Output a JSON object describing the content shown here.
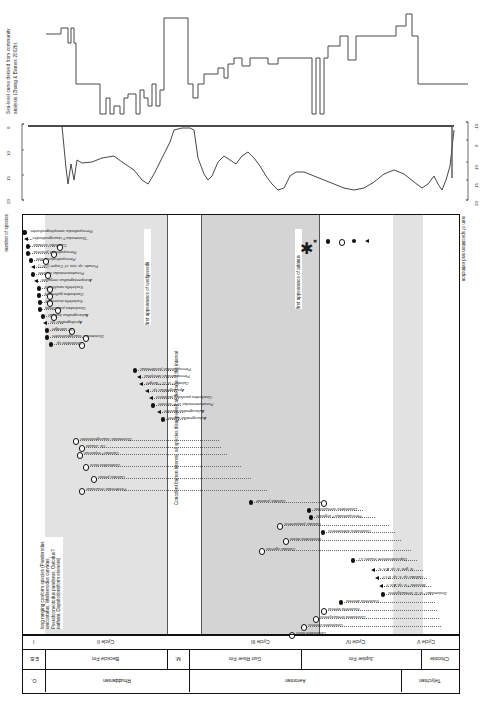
{
  "figure": {
    "panel_a": {
      "label": "Sea-level curve derived from community analysis (Zhang & Barnes 2002b)",
      "series_name": "sea-level-step-curve"
    },
    "panel_b": {
      "left_axis_ticks": [
        "0",
        "10",
        "15",
        "20"
      ],
      "right_axis_ticks": [
        "-10",
        "0",
        "10",
        "15",
        "20"
      ],
      "series_name": "bathymetry-curve"
    },
    "panel_c": {
      "left_axis_label": "number of species",
      "right_axis_label": "sum of speciation and extinction",
      "annotations": [
        "first appearance of wedgewedii",
        "Conodont barren interval, all species disappeared at the base of the interval",
        "first appearance of aitanus",
        "long ranging conform species (Panderodus unicostatus, Walliserodus curvatus, Pseudooneotodus panderus, Oulodus? nathani, Dapsilodontiform element)"
      ]
    },
    "legend": {
      "title": "legend",
      "entries": [
        {
          "symbol": "star",
          "label": "reappearance and last appearance at the same level"
        },
        {
          "symbol": "cross",
          "label": "reappearance"
        },
        {
          "symbol": "filled-circle",
          "label": "first and last appearance at the same level"
        },
        {
          "symbol": "open-circle",
          "label": "last appearance"
        },
        {
          "symbol": "filled-dot",
          "label": "first appearance"
        },
        {
          "symbol": "triangle",
          "label": "first appearance in Ordovician"
        }
      ]
    },
    "chart_data": {
      "type": "table",
      "title": "Conodont species ranges, Anticosti Island",
      "xlabel": "stratigraphic position",
      "ylabel": "species",
      "species": [
        {
          "name": "Pterospathodus amorphognathoides",
          "y": 228,
          "first": 1.5,
          "last": 3.0,
          "sym_first": "filled",
          "sym_last": "none"
        },
        {
          "name": "\"Distomodus? staurognathoides\"",
          "y": 235,
          "first": 3.0,
          "last": 8.0,
          "sym_first": "tri",
          "sym_last": "none"
        },
        {
          "name": "Carniodus carnulus",
          "y": 242,
          "first": 5.0,
          "last": 36.0,
          "sym_first": "filled",
          "sym_last": "open"
        },
        {
          "name": "Pterospathodus procerus",
          "y": 249,
          "first": 5.0,
          "last": 30.0,
          "sym_first": "filled",
          "sym_last": "open"
        },
        {
          "name": "Pterospathodus celloni",
          "y": 256,
          "first": 8.0,
          "last": 22.0,
          "sym_first": "filled",
          "sym_last": "open"
        },
        {
          "name": "Pseudo. sp. nov. cf. Cooper (1977)",
          "y": 263,
          "first": 10.0,
          "last": 22.0,
          "sym_first": "tri",
          "sym_last": "none"
        },
        {
          "name": "Pseudooneotodus tricornis",
          "y": 270,
          "first": 10.0,
          "last": 24.0,
          "sym_first": "filled",
          "sym_last": "open"
        },
        {
          "name": "Astropentagnathus irregularis",
          "y": 277,
          "first": 13.0,
          "last": 24.0,
          "sym_first": "tri",
          "sym_last": "none"
        },
        {
          "name": "Kockelella ranuliformis",
          "y": 284,
          "first": 16.0,
          "last": 26.0,
          "sym_first": "filled",
          "sym_last": "open"
        },
        {
          "name": "Ozarkodina gulletensis",
          "y": 291,
          "first": 16.0,
          "last": 26.0,
          "sym_first": "filled",
          "sym_last": "open"
        },
        {
          "name": "Kockelella inconstans",
          "y": 298,
          "first": 17.0,
          "last": 26.0,
          "sym_first": "filled",
          "sym_last": "open"
        },
        {
          "name": "Ozarkodina polinclinata",
          "y": 305,
          "first": 17.0,
          "last": 34.0,
          "sym_first": "filled",
          "sym_last": "open"
        },
        {
          "name": "Aulacognathus bullatus",
          "y": 312,
          "first": 20.0,
          "last": 30.0,
          "sym_first": "filled",
          "sym_last": "open"
        },
        {
          "name": "Apsidognathus sp.",
          "y": 319,
          "first": 22.0,
          "last": 40.0,
          "sym_first": "tri",
          "sym_last": "none"
        },
        {
          "name": "Oz. aldridgei",
          "y": 326,
          "first": 24.0,
          "last": 48.0,
          "sym_first": "filled",
          "sym_last": "open"
        },
        {
          "name": "Distomodus staurognathoides",
          "y": 333,
          "first": 24.0,
          "last": 62.0,
          "sym_first": "filled",
          "sym_last": "open"
        },
        {
          "name": "Ozarkodina sp.",
          "y": 340,
          "first": 28.0,
          "last": 58.0,
          "sym_first": "filled",
          "sym_last": "open"
        },
        {
          "name": "Pterospathodus postdentatus",
          "y": 366,
          "first": 112.0,
          "last": 150.0,
          "sym_first": "filled",
          "sym_last": "none"
        },
        {
          "name": "Pterospathodus amorphus",
          "y": 373,
          "first": 116.0,
          "last": 152.0,
          "sym_first": "tri",
          "sym_last": "none"
        },
        {
          "name": "Oulodus? cf. O.? fluegeli",
          "y": 380,
          "first": 118.0,
          "last": 152.0,
          "sym_first": "tri",
          "sym_last": "none"
        },
        {
          "name": "Apsidognathus sp.",
          "y": 387,
          "first": 124.0,
          "last": 154.0,
          "sym_first": "tri",
          "sym_last": "none"
        },
        {
          "name": "Ozarkodina parahassi parahassi",
          "y": 394,
          "first": 128.0,
          "last": 156.0,
          "sym_first": "tri",
          "sym_last": "none"
        },
        {
          "name": "Pseudooneotodus cf. P. bicornis",
          "y": 401,
          "first": 130.0,
          "last": 158.0,
          "sym_first": "filled",
          "sym_last": "none"
        },
        {
          "name": "Aulacognathus bashkiri",
          "y": 408,
          "first": 136.0,
          "last": 160.0,
          "sym_first": "tri",
          "sym_last": "none"
        },
        {
          "name": "Aulacognathus kuehni",
          "y": 415,
          "first": 140.0,
          "last": 162.0,
          "sym_first": "filled",
          "sym_last": "none"
        },
        {
          "name": "Distomodus staurognathoides",
          "y": 436,
          "first": 52.0,
          "last": 196.0,
          "sym_first": "open",
          "sym_last": "none"
        },
        {
          "name": "Oz. clavula",
          "y": 443,
          "first": 58.0,
          "last": 198.0,
          "sym_first": "open",
          "sym_last": "none"
        },
        {
          "name": "Oulodus? expansus",
          "y": 450,
          "first": 56.0,
          "last": 204.0,
          "sym_first": "open",
          "sym_last": "none"
        },
        {
          "name": "Ozarkodina hassi",
          "y": 462,
          "first": 62.0,
          "last": 218.0,
          "sym_first": "open",
          "sym_last": "none"
        },
        {
          "name": "Oulodus petilus",
          "y": 474,
          "first": 70.0,
          "last": 228.0,
          "sym_first": "open",
          "sym_last": "none"
        },
        {
          "name": "Panderodus recurvatus",
          "y": 486,
          "first": 58.0,
          "last": 244.0,
          "sym_first": "open",
          "sym_last": "none"
        },
        {
          "name": "Oulodus jeannae",
          "y": 498,
          "first": 228.0,
          "last": 300.0,
          "sym_first": "filled",
          "sym_last": "open"
        },
        {
          "name": "Ozarkodina strenuiformis",
          "y": 506,
          "first": 286.0,
          "last": 340.0,
          "sym_first": "filled",
          "sym_last": "none"
        },
        {
          "name": "Pterospathodus? originalis",
          "y": 513,
          "first": 288.0,
          "last": 352.0,
          "sym_first": "filled",
          "sym_last": "none"
        },
        {
          "name": "Oulodus panuarensis",
          "y": 521,
          "first": 256.0,
          "last": 366.0,
          "sym_first": "open",
          "sym_last": "none"
        },
        {
          "name": "Ozarkodina oldhamensis",
          "y": 528,
          "first": 300.0,
          "last": 372.0,
          "sym_first": "filled",
          "sym_last": "none"
        },
        {
          "name": "Ozarkodina divina",
          "y": 536,
          "first": 262.0,
          "last": 378.0,
          "sym_first": "open",
          "sym_last": "none"
        },
        {
          "name": "Oulodus agrestis",
          "y": 546,
          "first": 238.0,
          "last": 388.0,
          "sym_first": "open",
          "sym_last": "none"
        },
        {
          "name": "Dapsilodontiform elutans s.l.",
          "y": 556,
          "first": 330.0,
          "last": 394.0,
          "sym_first": "filled",
          "sym_last": "none"
        },
        {
          "name": "N. gen. n. sp. A n. n.",
          "y": 566,
          "first": 350.0,
          "last": 400.0,
          "sym_first": "tri",
          "sym_last": "none"
        },
        {
          "name": "Oulodus sp. n. sp. B s.f.",
          "y": 574,
          "first": 354.0,
          "last": 404.0,
          "sym_first": "tri",
          "sym_last": "none"
        },
        {
          "name": "Besselia ? n. sp. A n. f.",
          "y": 582,
          "first": 358.0,
          "last": 408.0,
          "sym_first": "tri",
          "sym_last": "none"
        },
        {
          "name": "Distomodus? cf. D. kentuckyensis",
          "y": 590,
          "first": 360.0,
          "last": 410.0,
          "sym_first": "filled",
          "sym_last": "none"
        },
        {
          "name": "Kockelella dekenta",
          "y": 598,
          "first": 318.0,
          "last": 412.0,
          "sym_first": "filled",
          "sym_last": "none"
        },
        {
          "name": "Kockelella defecta",
          "y": 606,
          "first": 300.0,
          "last": 414.0,
          "sym_first": "open",
          "sym_last": "none"
        },
        {
          "name": "Ozarkodina kentuckyensis",
          "y": 614,
          "first": 292.0,
          "last": 416.0,
          "sym_first": "open",
          "sym_last": "none"
        },
        {
          "name": "Ozarkodina chiensis",
          "y": 622,
          "first": 280.0,
          "last": 418.0,
          "sym_first": "open",
          "sym_last": "none"
        },
        {
          "name": "Ozarkodina hassi",
          "y": 630,
          "first": 268.0,
          "last": 420.0,
          "sym_first": "open",
          "sym_last": "none"
        }
      ]
    }
  },
  "stratigraphy": {
    "rows": [
      {
        "name": "cycles",
        "cells": [
          {
            "label": "I",
            "x": 0,
            "w": 22
          },
          {
            "label": "Cycle II",
            "x": 22,
            "w": 122
          },
          {
            "label": "",
            "x": 144,
            "w": 34
          },
          {
            "label": "Cycle III",
            "x": 178,
            "w": 118
          },
          {
            "label": "Cycle IV",
            "x": 296,
            "w": 74
          },
          {
            "label": "Cycle V",
            "x": 370,
            "w": 66
          }
        ]
      },
      {
        "name": "formations",
        "cells": [
          {
            "label": "E.B.",
            "x": 0,
            "w": 22
          },
          {
            "label": "Becscie Fm",
            "x": 22,
            "w": 122
          },
          {
            "label": "M.",
            "x": 144,
            "w": 22
          },
          {
            "label": "Gun River Fm",
            "x": 166,
            "w": 112
          },
          {
            "label": "Jupiter Fm",
            "x": 278,
            "w": 120
          },
          {
            "label": "Chicotte",
            "x": 398,
            "w": 38
          }
        ]
      },
      {
        "name": "stages",
        "cells": [
          {
            "label": "O.",
            "x": 0,
            "w": 22
          },
          {
            "label": "Rhuddanian",
            "x": 22,
            "w": 144
          },
          {
            "label": "Aeronian",
            "x": 166,
            "w": 212
          },
          {
            "label": "Telychian",
            "x": 378,
            "w": 58
          }
        ]
      }
    ]
  },
  "colors": {
    "band_light": "#e2e2e2",
    "band_dark": "#d4d4d4",
    "grey_bar": "#a8a8a8",
    "line": "#333333",
    "symbol": "#111111"
  }
}
